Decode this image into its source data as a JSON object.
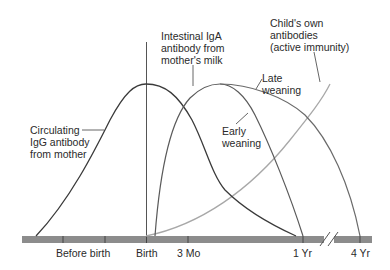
{
  "diagram": {
    "axis": {
      "ticks": [
        {
          "id": "before-birth",
          "label": "Before birth"
        },
        {
          "id": "birth",
          "label": "Birth"
        },
        {
          "id": "3mo",
          "label": "3 Mo"
        },
        {
          "id": "1yr",
          "label": "1 Yr"
        },
        {
          "id": "4yr",
          "label": "4 Yr"
        }
      ],
      "bar_color": "#8c8c8c",
      "break_marker": "//"
    },
    "labels": {
      "igg": [
        "Circulating",
        "IgG antibody",
        "from mother"
      ],
      "iga": [
        "Intestinal IgA",
        "antibody from",
        "mother's milk"
      ],
      "own": [
        "Child's own",
        "antibodies",
        "(active immunity)"
      ],
      "late": [
        "Late",
        "weaning"
      ],
      "early": [
        "Early",
        "weaning"
      ]
    },
    "curves": [
      {
        "name": "Circulating IgG antibody from mother",
        "color": "#3a3a3a"
      },
      {
        "name": "Intestinal IgA antibody - early weaning",
        "color": "#5a5a5a"
      },
      {
        "name": "Intestinal IgA antibody - late weaning",
        "color": "#6a6a6a"
      },
      {
        "name": "Child's own antibodies (active immunity)",
        "color": "#a8a8a8"
      }
    ]
  }
}
